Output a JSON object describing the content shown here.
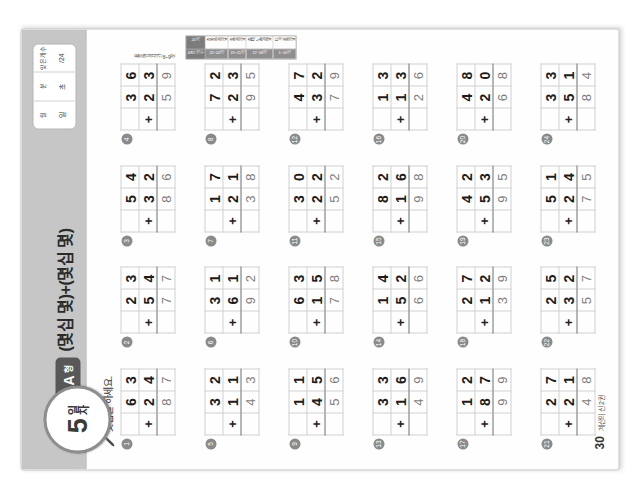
{
  "worksheet": {
    "day_number": "5",
    "day_label": "일차",
    "form_letter": "A",
    "form_word": "형",
    "title": "(몇십 몇)+(몇십 몇)",
    "instruction": "덧셈을 하세요.",
    "pencil_icon": "pencil-icon",
    "score_box": {
      "columns": [
        {
          "head": "월",
          "value": "일"
        },
        {
          "head": "분",
          "value": "초"
        },
        {
          "head": "맞은 개수",
          "value": "/24"
        }
      ]
    },
    "footer": {
      "page_number": "30",
      "text": "계산의 신 2권"
    },
    "reference": {
      "caption": "표준완성시간 8~9분",
      "rows": [
        {
          "key": "맞은 개수",
          "value": "24개"
        },
        {
          "key": "22~24개",
          "value": "참 잘했어요"
        },
        {
          "key": "19~21개",
          "value": "잘했어요"
        },
        {
          "key": "17~18개",
          "value": "좀더 노력해요"
        },
        {
          "key": "1~16개",
          "value": "다시 풀어요"
        }
      ]
    }
  },
  "problems": [
    {
      "num": "1",
      "a": "63",
      "b": "24",
      "sum": "87"
    },
    {
      "num": "2",
      "a": "23",
      "b": "54",
      "sum": "77"
    },
    {
      "num": "3",
      "a": "54",
      "b": "32",
      "sum": "86"
    },
    {
      "num": "4",
      "a": "36",
      "b": "23",
      "sum": "59"
    },
    {
      "num": "5",
      "a": "32",
      "b": "11",
      "sum": "43"
    },
    {
      "num": "6",
      "a": "31",
      "b": "61",
      "sum": "92"
    },
    {
      "num": "7",
      "a": "17",
      "b": "21",
      "sum": "38"
    },
    {
      "num": "8",
      "a": "72",
      "b": "23",
      "sum": "95"
    },
    {
      "num": "9",
      "a": "11",
      "b": "45",
      "sum": "56"
    },
    {
      "num": "10",
      "a": "63",
      "b": "15",
      "sum": "78"
    },
    {
      "num": "11",
      "a": "30",
      "b": "22",
      "sum": "52"
    },
    {
      "num": "12",
      "a": "47",
      "b": "32",
      "sum": "79"
    },
    {
      "num": "13",
      "a": "33",
      "b": "16",
      "sum": "49"
    },
    {
      "num": "14",
      "a": "14",
      "b": "52",
      "sum": "66"
    },
    {
      "num": "15",
      "a": "82",
      "b": "16",
      "sum": "98"
    },
    {
      "num": "16",
      "a": "13",
      "b": "13",
      "sum": "26"
    },
    {
      "num": "17",
      "a": "12",
      "b": "87",
      "sum": "99"
    },
    {
      "num": "18",
      "a": "27",
      "b": "12",
      "sum": "39"
    },
    {
      "num": "19",
      "a": "42",
      "b": "53",
      "sum": "95"
    },
    {
      "num": "20",
      "a": "48",
      "b": "20",
      "sum": "68"
    },
    {
      "num": "21",
      "a": "27",
      "b": "21",
      "sum": "48"
    },
    {
      "num": "22",
      "a": "25",
      "b": "32",
      "sum": "57"
    },
    {
      "num": "23",
      "a": "51",
      "b": "24",
      "sum": "75"
    },
    {
      "num": "24",
      "a": "33",
      "b": "51",
      "sum": "84"
    }
  ],
  "operator": "+"
}
